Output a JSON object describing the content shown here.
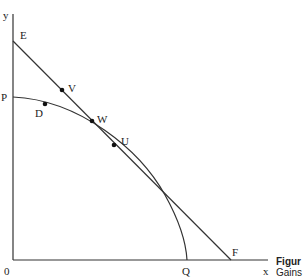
{
  "diagram": {
    "axes": {
      "y_label": "y",
      "x_label": "x",
      "origin_label": "0"
    },
    "curves": [
      {
        "name": "production-possibility-frontier",
        "from": "P",
        "to": "Q",
        "type": "concave-curve"
      },
      {
        "name": "price-line",
        "from": "E",
        "to": "F",
        "type": "straight-line",
        "tangent_at": "U"
      }
    ],
    "points": [
      {
        "label": "E",
        "x": 13,
        "y": 41
      },
      {
        "label": "P",
        "x": 13,
        "y": 97
      },
      {
        "label": "D",
        "x": 45,
        "y": 104,
        "marker": true
      },
      {
        "label": "V",
        "x": 62,
        "y": 90,
        "marker": true
      },
      {
        "label": "W",
        "x": 92,
        "y": 121,
        "marker": true
      },
      {
        "label": "U",
        "x": 114,
        "y": 145,
        "marker": true
      },
      {
        "label": "Q",
        "x": 187,
        "y": 260
      },
      {
        "label": "F",
        "x": 231,
        "y": 260
      }
    ]
  },
  "caption": {
    "line1": "Figur",
    "line2": "Gains"
  }
}
